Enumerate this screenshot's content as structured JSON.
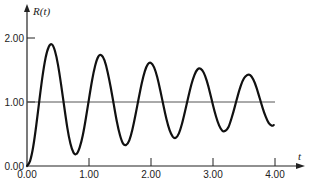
{
  "chart_data": {
    "type": "line",
    "title": "",
    "xlabel": "t",
    "ylabel": "R(t)",
    "xlim": [
      0,
      4.0
    ],
    "ylim": [
      0,
      2.0
    ],
    "grid": false,
    "x_ticks": [
      "0.00",
      "1.00",
      "2.00",
      "3.00",
      "4.00"
    ],
    "y_ticks": [
      "0.00",
      "1.00",
      "2.00"
    ],
    "reference_line": {
      "y": 1.0,
      "from": 0.0,
      "to": 4.0
    },
    "extrema": [
      {
        "t": 0.39,
        "R": 1.9,
        "kind": "peak"
      },
      {
        "t": 0.77,
        "R": 0.19,
        "kind": "trough"
      },
      {
        "t": 1.19,
        "R": 1.73,
        "kind": "peak"
      },
      {
        "t": 1.58,
        "R": 0.33,
        "kind": "trough"
      },
      {
        "t": 1.98,
        "R": 1.61,
        "kind": "peak"
      },
      {
        "t": 2.39,
        "R": 0.44,
        "kind": "trough"
      },
      {
        "t": 2.79,
        "R": 1.52,
        "kind": "peak"
      },
      {
        "t": 3.2,
        "R": 0.55,
        "kind": "trough"
      },
      {
        "t": 3.6,
        "R": 1.42,
        "kind": "peak"
      }
    ],
    "series": [
      {
        "name": "R(t)",
        "x": [
          0.0,
          0.05,
          0.1,
          0.15,
          0.2,
          0.25,
          0.3,
          0.35,
          0.4,
          0.45,
          0.5,
          0.55,
          0.6,
          0.65,
          0.7,
          0.75,
          0.8,
          0.85,
          0.9,
          0.95,
          1.0,
          1.05,
          1.1,
          1.15,
          1.2,
          1.25,
          1.3,
          1.35,
          1.4,
          1.45,
          1.5,
          1.55,
          1.6,
          1.65,
          1.7,
          1.75,
          1.8,
          1.85,
          1.9,
          1.95,
          2.0,
          2.05,
          2.1,
          2.15,
          2.2,
          2.25,
          2.3,
          2.35,
          2.4,
          2.45,
          2.5,
          2.55,
          2.6,
          2.65,
          2.7,
          2.75,
          2.8,
          2.85,
          2.9,
          2.95,
          3.0,
          3.05,
          3.1,
          3.15,
          3.2,
          3.25,
          3.3,
          3.35,
          3.4,
          3.45,
          3.5,
          3.55,
          3.6,
          3.65,
          3.7,
          3.75,
          3.8,
          3.85,
          3.9,
          3.95,
          3.98
        ],
        "values": [
          0.0,
          0.08,
          0.3,
          0.64,
          1.03,
          1.4,
          1.69,
          1.86,
          1.9,
          1.8,
          1.58,
          1.27,
          0.93,
          0.6,
          0.35,
          0.21,
          0.19,
          0.29,
          0.48,
          0.75,
          1.05,
          1.34,
          1.57,
          1.71,
          1.73,
          1.65,
          1.47,
          1.23,
          0.96,
          0.69,
          0.48,
          0.35,
          0.33,
          0.4,
          0.57,
          0.8,
          1.05,
          1.29,
          1.48,
          1.59,
          1.61,
          1.54,
          1.39,
          1.18,
          0.95,
          0.73,
          0.56,
          0.46,
          0.44,
          0.51,
          0.66,
          0.86,
          1.07,
          1.27,
          1.42,
          1.51,
          1.52,
          1.46,
          1.33,
          1.15,
          0.95,
          0.77,
          0.63,
          0.55,
          0.55,
          0.61,
          0.75,
          0.92,
          1.1,
          1.26,
          1.37,
          1.42,
          1.42,
          1.35,
          1.23,
          1.07,
          0.91,
          0.77,
          0.67,
          0.63,
          0.64
        ]
      }
    ]
  }
}
